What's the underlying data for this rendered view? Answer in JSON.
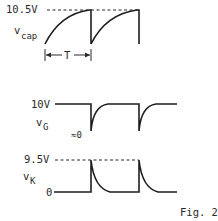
{
  "figure": {
    "caption": "Fig. 2",
    "colors": {
      "ink": "#1e1e1e",
      "background": "#ffffff"
    }
  },
  "vcap": {
    "name_main": "v",
    "name_sub": "cap",
    "peak_label": "10.5V",
    "period_label": "T",
    "waveform": "sawtooth (exponential charge, sharp discharge)"
  },
  "vG": {
    "name_main": "v",
    "name_sub": "G",
    "high_label": "10V",
    "low_label": "≈0",
    "waveform": "negative pulses with exponential recovery"
  },
  "vK": {
    "name_main": "v",
    "name_sub": "K",
    "peak_label": "9.5V",
    "base_label": "0",
    "waveform": "positive spikes with exponential decay"
  }
}
